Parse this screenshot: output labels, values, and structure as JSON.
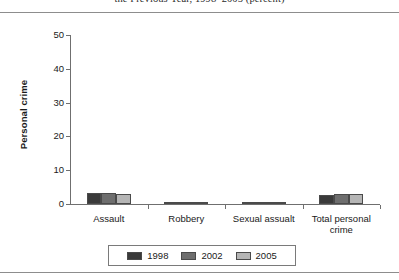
{
  "title": {
    "text": "the Previous Year, 1998–2005 (percent)",
    "clipped": true
  },
  "chart_data": {
    "type": "bar",
    "title": "the Previous Year, 1998–2005 (percent)",
    "xlabel": "",
    "ylabel": "Personal crime",
    "ylim": [
      0,
      50
    ],
    "yticks": [
      0,
      10,
      20,
      30,
      40,
      50
    ],
    "ytick_labels": [
      "0",
      "10",
      "20",
      "30",
      "40",
      "50"
    ],
    "grid": false,
    "legend_position": "bottom",
    "categories": [
      "Assault",
      "Robbery",
      "Sexual assualt",
      "Total personal\ncrime"
    ],
    "series": [
      {
        "name": "1998",
        "color": "#3a3a3a",
        "values": [
          3.2,
          0.35,
          0.3,
          2.6
        ]
      },
      {
        "name": "2002",
        "color": "#6e6e6e",
        "values": [
          3.2,
          0.3,
          0.3,
          3.0
        ]
      },
      {
        "name": "2005",
        "color": "#b5b5b5",
        "values": [
          3.1,
          0.25,
          0.25,
          3.0
        ]
      }
    ]
  },
  "legend": {
    "items": [
      {
        "label": "1998",
        "color": "#3a3a3a"
      },
      {
        "label": "2002",
        "color": "#6e6e6e"
      },
      {
        "label": "2005",
        "color": "#b5b5b5"
      }
    ]
  }
}
